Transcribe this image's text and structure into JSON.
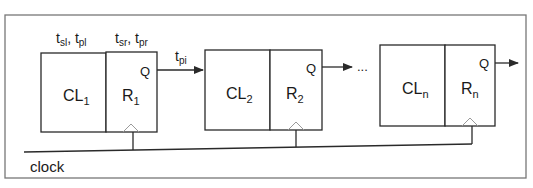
{
  "diagram": {
    "stages": [
      {
        "cl_label": "CL",
        "cl_sub": "1",
        "reg_label": "R",
        "reg_sub": "1",
        "output": "Q"
      },
      {
        "cl_label": "CL",
        "cl_sub": "2",
        "reg_label": "R",
        "reg_sub": "2",
        "output": "Q"
      },
      {
        "cl_label": "CL",
        "cl_sub": "n",
        "reg_label": "R",
        "reg_sub": "n",
        "output": "Q"
      }
    ],
    "annotations": {
      "logic_timing": {
        "t1": "t",
        "s1": "sl",
        "sep": ", ",
        "t2": "t",
        "s2": "pl"
      },
      "reg_timing": {
        "t1": "t",
        "s1": "sr",
        "sep": ", ",
        "t2": "t",
        "s2": "pr"
      },
      "interconnect": {
        "t": "t",
        "s": "pi"
      }
    },
    "ellipsis": "...",
    "clock_label": "clock",
    "colors": {
      "line": "#2a2a2a",
      "frame": "#777777",
      "triangle": "#9a9a9a"
    }
  }
}
